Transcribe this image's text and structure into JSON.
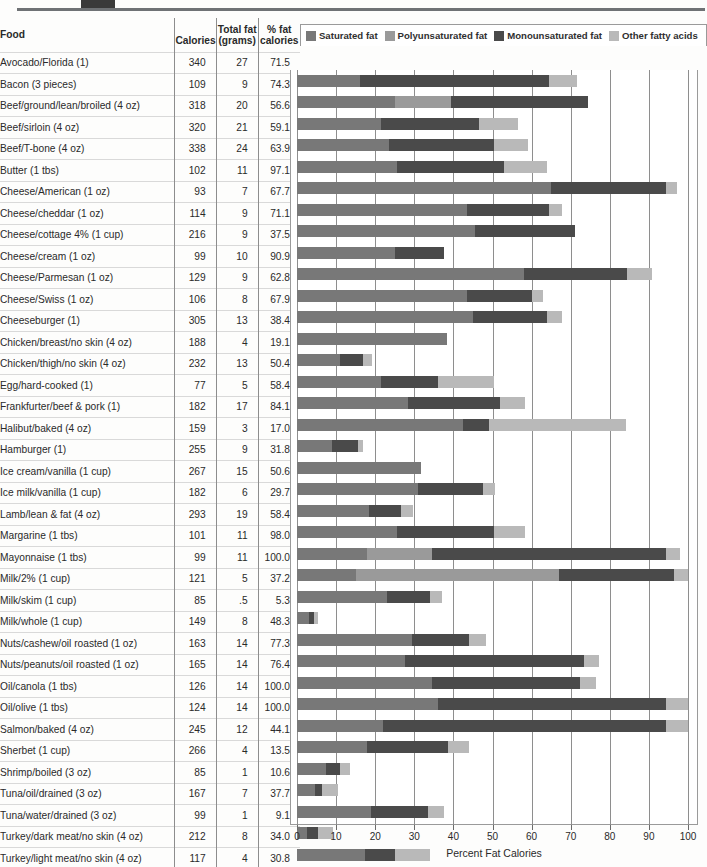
{
  "decoration": {
    "block_color": "#3a3a3a",
    "rule_color": "#6f7275"
  },
  "header": {
    "food": "Food",
    "calories": "Calories",
    "total_fat_line1": "Total fat",
    "total_fat_line2": "(grams)",
    "pct_fat_line1": "% fat",
    "pct_fat_line2": "calories"
  },
  "legend": [
    {
      "label": "Saturated fat",
      "color": "#787878"
    },
    {
      "label": "Polyunsaturated fat",
      "color": "#9a9a9a"
    },
    {
      "label": "Monounsaturated fat",
      "color": "#4a4a4a"
    },
    {
      "label": "Other fatty acids",
      "color": "#b9b9b9"
    }
  ],
  "axis": {
    "ticks": [
      0,
      10,
      20,
      30,
      40,
      50,
      60,
      70,
      80,
      90,
      100
    ],
    "title": "Percent Fat Calories",
    "min": 0,
    "max": 100
  },
  "chart_data": {
    "type": "bar",
    "orientation": "horizontal",
    "stacked": true,
    "xlabel": "Percent Fat Calories",
    "ylabel": "Food",
    "xlim": [
      0,
      100
    ],
    "grid": true,
    "legend_position": "top",
    "series": [
      {
        "name": "Saturated fat",
        "color": "#787878"
      },
      {
        "name": "Polyunsaturated fat",
        "color": "#9a9a9a"
      },
      {
        "name": "Monounsaturated fat",
        "color": "#4a4a4a"
      },
      {
        "name": "Other fatty acids",
        "color": "#b9b9b9"
      }
    ],
    "categories": [
      "Avocado/Florida (1)",
      "Bacon (3 pieces)",
      "Beef/ground/lean/broiled (4 oz)",
      "Beef/sirloin (4 oz)",
      "Beef/T-bone (4 oz)",
      "Butter (1 tbs)",
      "Cheese/American (1 oz)",
      "Cheese/cheddar (1 oz)",
      "Cheese/cottage 4% (1 cup)",
      "Cheese/cream (1 oz)",
      "Cheese/Parmesan (1 oz)",
      "Cheese/Swiss (1 oz)",
      "Cheeseburger (1)",
      "Chicken/breast/no skin (4 oz)",
      "Chicken/thigh/no skin (4 oz)",
      "Egg/hard-cooked (1)",
      "Frankfurter/beef & pork (1)",
      "Halibut/baked (4 oz)",
      "Hamburger (1)",
      "Ice cream/vanilla (1 cup)",
      "Ice milk/vanilla (1 cup)",
      "Lamb/lean & fat (4 oz)",
      "Margarine (1 tbs)",
      "Mayonnaise (1 tbs)",
      "Milk/2% (1 cup)",
      "Milk/skim (1 cup)",
      "Milk/whole (1 cup)",
      "Nuts/cashew/oil roasted (1 oz)",
      "Nuts/peanuts/oil roasted (1 oz)",
      "Oil/canola (1 tbs)",
      "Oil/olive (1 tbs)",
      "Salmon/baked (4 oz)",
      "Sherbet (1 cup)",
      "Shrimp/boiled (3 oz)",
      "Tuna/oil/drained (3 oz)",
      "Tuna/water/drained (3 oz)",
      "Turkey/dark meat/no skin (4 oz)",
      "Turkey/light meat/no skin (4 oz)"
    ],
    "totals": [
      71.5,
      74.3,
      56.6,
      59.1,
      63.9,
      97.1,
      67.7,
      71.1,
      37.5,
      90.9,
      62.8,
      67.9,
      38.4,
      19.1,
      50.4,
      58.4,
      84.1,
      17.0,
      31.8,
      50.6,
      29.7,
      58.4,
      98.0,
      100.0,
      37.2,
      5.3,
      48.3,
      77.3,
      76.4,
      100.0,
      100.0,
      44.1,
      13.5,
      10.6,
      37.7,
      9.1,
      34.0,
      30.8
    ]
  },
  "rows": [
    {
      "food": "Avocado/Florida (1)",
      "calories": "340",
      "fat_g": "27",
      "pct": "71.5",
      "segs": [
        16.0,
        0.0,
        48.5,
        7.0
      ]
    },
    {
      "food": "Bacon (3 pieces)",
      "calories": "109",
      "fat_g": "9",
      "pct": "74.3",
      "segs": [
        25.0,
        14.5,
        34.8,
        0.0
      ]
    },
    {
      "food": "Beef/ground/lean/broiled (4 oz)",
      "calories": "318",
      "fat_g": "20",
      "pct": "56.6",
      "segs": [
        21.5,
        0.0,
        25.0,
        10.1
      ]
    },
    {
      "food": "Beef/sirloin (4 oz)",
      "calories": "320",
      "fat_g": "21",
      "pct": "59.1",
      "segs": [
        23.5,
        0.0,
        27.0,
        8.6
      ]
    },
    {
      "food": "Beef/T-bone (4 oz)",
      "calories": "338",
      "fat_g": "24",
      "pct": "63.9",
      "segs": [
        25.5,
        0.0,
        27.5,
        10.9
      ]
    },
    {
      "food": "Butter (1 tbs)",
      "calories": "102",
      "fat_g": "11",
      "pct": "97.1",
      "segs": [
        65.0,
        0.0,
        29.5,
        2.6
      ]
    },
    {
      "food": "Cheese/American (1 oz)",
      "calories": "93",
      "fat_g": "7",
      "pct": "67.7",
      "segs": [
        43.5,
        0.0,
        21.0,
        3.2
      ]
    },
    {
      "food": "Cheese/cheddar (1 oz)",
      "calories": "114",
      "fat_g": "9",
      "pct": "71.1",
      "segs": [
        45.5,
        0.0,
        25.6,
        0.0
      ]
    },
    {
      "food": "Cheese/cottage 4% (1 cup)",
      "calories": "216",
      "fat_g": "9",
      "pct": "37.5",
      "segs": [
        25.0,
        0.0,
        12.5,
        0.0
      ]
    },
    {
      "food": "Cheese/cream (1 oz)",
      "calories": "99",
      "fat_g": "10",
      "pct": "90.9",
      "segs": [
        58.0,
        0.0,
        26.5,
        6.4
      ]
    },
    {
      "food": "Cheese/Parmesan (1 oz)",
      "calories": "129",
      "fat_g": "9",
      "pct": "62.8",
      "segs": [
        43.5,
        0.0,
        16.5,
        2.8
      ]
    },
    {
      "food": "Cheese/Swiss (1 oz)",
      "calories": "106",
      "fat_g": "8",
      "pct": "67.9",
      "segs": [
        45.0,
        0.0,
        19.0,
        3.9
      ]
    },
    {
      "food": "Cheeseburger (1)",
      "calories": "305",
      "fat_g": "13",
      "pct": "38.4",
      "segs": [
        38.4,
        0.0,
        0.0,
        0.0
      ]
    },
    {
      "food": "Chicken/breast/no skin (4 oz)",
      "calories": "188",
      "fat_g": "4",
      "pct": "19.1",
      "segs": [
        11.0,
        0.0,
        6.0,
        2.1
      ]
    },
    {
      "food": "Chicken/thigh/no skin (4 oz)",
      "calories": "232",
      "fat_g": "13",
      "pct": "50.4",
      "segs": [
        21.5,
        0.0,
        14.5,
        14.4
      ]
    },
    {
      "food": "Egg/hard-cooked (1)",
      "calories": "77",
      "fat_g": "5",
      "pct": "58.4",
      "segs": [
        28.5,
        0.0,
        23.5,
        6.4
      ]
    },
    {
      "food": "Frankfurter/beef & pork (1)",
      "calories": "182",
      "fat_g": "17",
      "pct": "84.1",
      "segs": [
        42.5,
        0.0,
        6.5,
        35.1
      ]
    },
    {
      "food": "Halibut/baked (4 oz)",
      "calories": "159",
      "fat_g": "3",
      "pct": "17.0",
      "segs": [
        9.0,
        0.0,
        6.5,
        1.5
      ]
    },
    {
      "food": "Hamburger (1)",
      "calories": "255",
      "fat_g": "9",
      "pct": "31.8",
      "segs": [
        31.8,
        0.0,
        0.0,
        0.0
      ]
    },
    {
      "food": "Ice cream/vanilla (1 cup)",
      "calories": "267",
      "fat_g": "15",
      "pct": "50.6",
      "segs": [
        31.0,
        0.0,
        16.5,
        3.1
      ]
    },
    {
      "food": "Ice milk/vanilla (1 cup)",
      "calories": "182",
      "fat_g": "6",
      "pct": "29.7",
      "segs": [
        18.5,
        0.0,
        8.2,
        3.0
      ]
    },
    {
      "food": "Lamb/lean & fat (4 oz)",
      "calories": "293",
      "fat_g": "19",
      "pct": "58.4",
      "segs": [
        25.5,
        0.0,
        25.0,
        7.9
      ]
    },
    {
      "food": "Margarine (1 tbs)",
      "calories": "101",
      "fat_g": "11",
      "pct": "98.0",
      "segs": [
        18.0,
        16.5,
        60.0,
        3.5
      ]
    },
    {
      "food": "Mayonnaise (1 tbs)",
      "calories": "99",
      "fat_g": "11",
      "pct": "100.0",
      "segs": [
        15.0,
        52.0,
        29.5,
        3.5
      ]
    },
    {
      "food": "Milk/2% (1 cup)",
      "calories": "121",
      "fat_g": "5",
      "pct": "37.2",
      "segs": [
        23.0,
        0.0,
        11.0,
        3.2
      ]
    },
    {
      "food": "Milk/skim (1 cup)",
      "calories": "85",
      "fat_g": ".5",
      "pct": "5.3",
      "segs": [
        3.0,
        0.0,
        1.3,
        1.0
      ]
    },
    {
      "food": "Milk/whole (1 cup)",
      "calories": "149",
      "fat_g": "8",
      "pct": "48.3",
      "segs": [
        29.5,
        0.0,
        14.5,
        4.3
      ]
    },
    {
      "food": "Nuts/cashew/oil roasted (1 oz)",
      "calories": "163",
      "fat_g": "14",
      "pct": "77.3",
      "segs": [
        27.5,
        0.0,
        46.0,
        3.8
      ]
    },
    {
      "food": "Nuts/peanuts/oil roasted (1 oz)",
      "calories": "165",
      "fat_g": "14",
      "pct": "76.4",
      "segs": [
        34.5,
        0.0,
        38.0,
        3.9
      ]
    },
    {
      "food": "Oil/canola (1 tbs)",
      "calories": "126",
      "fat_g": "14",
      "pct": "100.0",
      "segs": [
        36.0,
        0.0,
        58.5,
        5.5
      ]
    },
    {
      "food": "Oil/olive (1 tbs)",
      "calories": "124",
      "fat_g": "14",
      "pct": "100.0",
      "segs": [
        22.0,
        0.0,
        72.5,
        5.5
      ]
    },
    {
      "food": "Salmon/baked (4 oz)",
      "calories": "245",
      "fat_g": "12",
      "pct": "44.1",
      "segs": [
        18.0,
        0.0,
        20.5,
        5.6
      ]
    },
    {
      "food": "Sherbet (1 cup)",
      "calories": "266",
      "fat_g": "4",
      "pct": "13.5",
      "segs": [
        7.5,
        0.0,
        3.5,
        2.5
      ]
    },
    {
      "food": "Shrimp/boiled (3 oz)",
      "calories": "85",
      "fat_g": "1",
      "pct": "10.6",
      "segs": [
        4.5,
        0.0,
        2.0,
        4.1
      ]
    },
    {
      "food": "Tuna/oil/drained (3 oz)",
      "calories": "167",
      "fat_g": "7",
      "pct": "37.7",
      "segs": [
        19.0,
        0.0,
        14.5,
        4.2
      ]
    },
    {
      "food": "Tuna/water/drained (3 oz)",
      "calories": "99",
      "fat_g": "1",
      "pct": "9.1",
      "segs": [
        2.5,
        0.0,
        3.0,
        3.6
      ]
    },
    {
      "food": "Turkey/dark meat/no skin (4 oz)",
      "calories": "212",
      "fat_g": "8",
      "pct": "34.0",
      "segs": [
        17.5,
        0.0,
        7.5,
        9.0
      ]
    },
    {
      "food": "Turkey/light meat/no skin (4 oz)",
      "calories": "117",
      "fat_g": "4",
      "pct": "30.8",
      "segs": [
        13.5,
        0.0,
        6.5,
        10.8
      ]
    }
  ]
}
